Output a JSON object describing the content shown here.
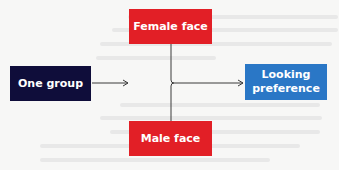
{
  "diagram": {
    "nodes": [
      {
        "id": "one-group",
        "label": "One group",
        "color": "#0f0d3a"
      },
      {
        "id": "female-face",
        "label": "Female face",
        "color": "#e21f26"
      },
      {
        "id": "male-face",
        "label": "Male face",
        "color": "#e21f26"
      },
      {
        "id": "looking-preference",
        "label_lines": [
          "Looking",
          "preference"
        ],
        "color": "#2a77c6"
      }
    ],
    "edges": [
      {
        "from": "one-group",
        "to": "female-face/male-face"
      },
      {
        "from": "female-face/male-face",
        "to": "looking-preference"
      }
    ],
    "connector_color": "#3a3a3a",
    "background_color": "#f7f7f6"
  }
}
